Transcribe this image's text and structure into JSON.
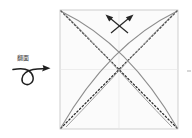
{
  "diagram": {
    "instruction": {
      "label": "翻面",
      "symbol_name": "turn-over-loop-arrow"
    },
    "paper": {
      "shape": "square",
      "fill_color": "#fbfbfb",
      "edge_color": "#c9c9c9",
      "left": 60,
      "top": 10,
      "width": 118,
      "height": 119
    },
    "creases": {
      "diagonal_style": "dotted",
      "diagonal_color": "#2b2b2b",
      "curve_style": "solid",
      "curve_color": "#8b8b8b",
      "center_line_color": "#e4e4e4"
    },
    "arrows": {
      "count": 2,
      "color": "#262626",
      "left_arrow_name": "fold-arrow-up-left",
      "right_arrow_name": "fold-arrow-up-right"
    },
    "edge_marker": {
      "name": "cropped-edge-mark",
      "color": "#9a9a9a"
    }
  }
}
